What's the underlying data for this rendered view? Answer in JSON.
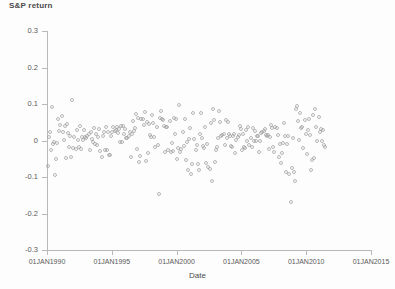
{
  "chart_data": {
    "type": "scatter",
    "title": "",
    "ylabel": "S&P return",
    "xlabel": "Date",
    "ylim": [
      -0.3,
      0.3
    ],
    "xlim": [
      "01JAN1990",
      "01JAN2015"
    ],
    "grid": false,
    "legend": "none",
    "marker": "open-circle",
    "marker_color": "#9d9d9d",
    "y_ticks": [
      "0.3",
      "0.2",
      "0.1",
      "0",
      "-0.1",
      "-0.2",
      "-0.3"
    ],
    "y_tick_values": [
      0.3,
      0.2,
      0.1,
      0,
      -0.1,
      -0.2,
      -0.3
    ],
    "x_ticks": [
      "01JAN1990",
      "01JAN1995",
      "01JAN2000",
      "01JAN2005",
      "01JAN2010",
      "01JAN2015"
    ],
    "x_tick_values": [
      1990.0,
      1995.0,
      2000.0,
      2005.0,
      2010.0,
      2015.0
    ],
    "series_name": "S&P return",
    "x": [
      1990.04,
      1990.12,
      1990.21,
      1990.29,
      1990.37,
      1990.46,
      1990.54,
      1990.62,
      1990.71,
      1990.79,
      1990.87,
      1990.96,
      1991.04,
      1991.12,
      1991.21,
      1991.29,
      1991.37,
      1991.46,
      1991.54,
      1991.62,
      1991.71,
      1991.79,
      1991.87,
      1991.96,
      1992.04,
      1992.12,
      1992.21,
      1992.29,
      1992.37,
      1992.46,
      1992.54,
      1992.62,
      1992.71,
      1992.79,
      1992.87,
      1992.96,
      1993.04,
      1993.12,
      1993.21,
      1993.29,
      1993.37,
      1993.46,
      1993.54,
      1993.62,
      1993.71,
      1993.79,
      1993.87,
      1993.96,
      1994.04,
      1994.12,
      1994.21,
      1994.29,
      1994.37,
      1994.46,
      1994.54,
      1994.62,
      1994.71,
      1994.79,
      1994.87,
      1994.96,
      1995.04,
      1995.12,
      1995.21,
      1995.29,
      1995.37,
      1995.46,
      1995.54,
      1995.62,
      1995.71,
      1995.79,
      1995.87,
      1995.96,
      1996.04,
      1996.12,
      1996.21,
      1996.29,
      1996.37,
      1996.46,
      1996.54,
      1996.62,
      1996.71,
      1996.79,
      1996.87,
      1996.96,
      1997.04,
      1997.12,
      1997.21,
      1997.29,
      1997.37,
      1997.46,
      1997.54,
      1997.62,
      1997.71,
      1997.79,
      1997.87,
      1997.96,
      1998.04,
      1998.12,
      1998.21,
      1998.29,
      1998.37,
      1998.46,
      1998.54,
      1998.62,
      1998.71,
      1998.79,
      1998.87,
      1998.96,
      1999.04,
      1999.12,
      1999.21,
      1999.29,
      1999.37,
      1999.46,
      1999.54,
      1999.62,
      1999.71,
      1999.79,
      1999.87,
      1999.96,
      2000.04,
      2000.12,
      2000.21,
      2000.29,
      2000.37,
      2000.46,
      2000.54,
      2000.62,
      2000.71,
      2000.79,
      2000.87,
      2000.96,
      2001.04,
      2001.12,
      2001.21,
      2001.29,
      2001.37,
      2001.46,
      2001.54,
      2001.62,
      2001.71,
      2001.79,
      2001.87,
      2001.96,
      2002.04,
      2002.12,
      2002.21,
      2002.29,
      2002.37,
      2002.46,
      2002.54,
      2002.62,
      2002.71,
      2002.79,
      2002.87,
      2002.96,
      2003.04,
      2003.12,
      2003.21,
      2003.29,
      2003.37,
      2003.46,
      2003.54,
      2003.62,
      2003.71,
      2003.79,
      2003.87,
      2003.96,
      2004.04,
      2004.12,
      2004.21,
      2004.29,
      2004.37,
      2004.46,
      2004.54,
      2004.62,
      2004.71,
      2004.79,
      2004.87,
      2004.96,
      2005.04,
      2005.12,
      2005.21,
      2005.29,
      2005.37,
      2005.46,
      2005.54,
      2005.62,
      2005.71,
      2005.79,
      2005.87,
      2005.96,
      2006.04,
      2006.12,
      2006.21,
      2006.29,
      2006.37,
      2006.46,
      2006.54,
      2006.62,
      2006.71,
      2006.79,
      2006.87,
      2006.96,
      2007.04,
      2007.12,
      2007.21,
      2007.29,
      2007.37,
      2007.46,
      2007.54,
      2007.62,
      2007.71,
      2007.79,
      2007.87,
      2007.96,
      2008.04,
      2008.12,
      2008.21,
      2008.29,
      2008.37,
      2008.46,
      2008.54,
      2008.62,
      2008.71,
      2008.79,
      2008.87,
      2008.96,
      2009.04,
      2009.12,
      2009.21,
      2009.29,
      2009.37,
      2009.46,
      2009.54,
      2009.62,
      2009.71,
      2009.79,
      2009.87,
      2009.96,
      2010.04,
      2010.12,
      2010.21,
      2010.29,
      2010.37,
      2010.46,
      2010.54,
      2010.62,
      2010.71,
      2010.79,
      2010.87,
      2010.96,
      2011.04,
      2011.12,
      2011.21,
      2011.29,
      2011.37,
      2011.46
    ],
    "y": [
      -0.069,
      0.009,
      0.024,
      -0.027,
      0.092,
      -0.009,
      -0.005,
      -0.094,
      -0.051,
      -0.007,
      0.06,
      0.025,
      0.042,
      0.067,
      0.022,
      0.001,
      0.039,
      -0.047,
      0.045,
      0.02,
      -0.019,
      0.012,
      -0.044,
      0.112,
      -0.02,
      0.01,
      -0.022,
      0.028,
      0.001,
      -0.017,
      0.039,
      -0.024,
      0.009,
      0.002,
      0.03,
      0.01,
      0.007,
      0.011,
      0.019,
      -0.025,
      0.023,
      0.003,
      -0.005,
      0.035,
      -0.01,
      0.019,
      -0.011,
      0.01,
      0.032,
      -0.03,
      -0.046,
      0.011,
      0.022,
      -0.027,
      0.038,
      -0.026,
      0.022,
      -0.039,
      -0.04,
      0.012,
      0.024,
      0.036,
      0.027,
      0.028,
      0.036,
      0.021,
      0.031,
      -0.003,
      0.04,
      -0.005,
      0.041,
      0.017,
      0.032,
      0.007,
      0.008,
      0.013,
      0.022,
      -0.046,
      0.018,
      0.053,
      0.026,
      0.033,
      0.073,
      -0.022,
      0.061,
      -0.058,
      -0.042,
      0.058,
      0.058,
      0.043,
      0.078,
      -0.057,
      0.052,
      -0.035,
      0.045,
      0.015,
      0.01,
      0.07,
      0.049,
      0.009,
      -0.018,
      0.038,
      -0.012,
      -0.146,
      0.062,
      0.08,
      0.059,
      0.056,
      0.041,
      -0.032,
      0.038,
      0.037,
      -0.025,
      0.054,
      -0.032,
      -0.006,
      -0.029,
      0.062,
      0.019,
      0.058,
      -0.051,
      -0.02,
      0.096,
      -0.031,
      -0.022,
      0.024,
      -0.016,
      0.06,
      -0.053,
      -0.005,
      -0.08,
      0.004,
      0.034,
      -0.092,
      -0.064,
      0.076,
      0.005,
      -0.025,
      -0.011,
      -0.064,
      -0.082,
      0.018,
      0.075,
      0.008,
      -0.016,
      -0.021,
      0.037,
      -0.061,
      -0.009,
      -0.072,
      -0.079,
      0.049,
      -0.11,
      0.086,
      0.057,
      -0.06,
      -0.027,
      -0.017,
      0.008,
      0.081,
      0.051,
      0.011,
      0.016,
      0.018,
      -0.012,
      0.055,
      0.007,
      0.05,
      0.017,
      0.012,
      -0.016,
      -0.017,
      0.012,
      0.018,
      -0.034,
      0.002,
      0.009,
      0.014,
      0.039,
      0.032,
      -0.025,
      0.019,
      -0.019,
      -0.02,
      0.03,
      0.0,
      0.036,
      -0.011,
      0.007,
      -0.018,
      0.035,
      0.0,
      0.025,
      0.0,
      0.011,
      0.012,
      -0.031,
      0.0,
      0.021,
      0.024,
      0.025,
      0.032,
      0.016,
      0.013,
      0.014,
      -0.022,
      0.01,
      0.043,
      0.033,
      -0.018,
      -0.032,
      0.038,
      0.035,
      0.015,
      -0.044,
      -0.009,
      -0.061,
      -0.035,
      -0.006,
      0.048,
      0.011,
      -0.086,
      -0.01,
      0.012,
      -0.091,
      -0.169,
      -0.075,
      0.008,
      -0.086,
      -0.11,
      0.085,
      0.094,
      0.053,
      0.002,
      0.074,
      0.034,
      0.036,
      -0.02,
      0.057,
      0.018,
      -0.037,
      0.029,
      0.059,
      0.015,
      -0.082,
      -0.054,
      0.069,
      -0.047,
      0.087,
      0.037,
      -0.002,
      0.065,
      0.023,
      0.032,
      -0.001,
      0.028,
      -0.011,
      -0.018
    ]
  },
  "axes": {
    "ylabel": "S&P return",
    "xlabel": "Date",
    "y_ticks": [
      "0.3",
      "0.2",
      "0.1",
      "0",
      "-0.1",
      "-0.2",
      "-0.3"
    ],
    "x_ticks": [
      "01JAN1990",
      "01JAN1995",
      "01JAN2000",
      "01JAN2005",
      "01JAN2010",
      "01JAN2015"
    ]
  }
}
